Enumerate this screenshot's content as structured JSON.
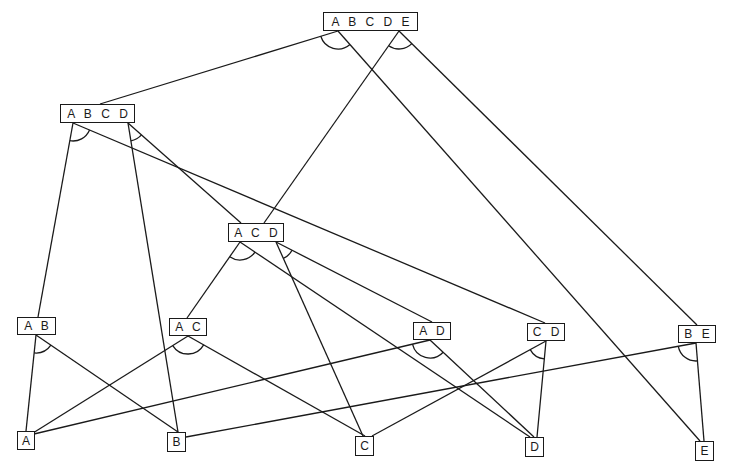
{
  "colors": {
    "stroke": "#1a1a1a",
    "background": "#ffffff"
  },
  "nodes": {
    "ABCDE": {
      "label": "A B C D E",
      "x": 323,
      "y": 12,
      "w": 95,
      "h": 19
    },
    "ABCD": {
      "label": "A B C D",
      "x": 60,
      "y": 104,
      "w": 75,
      "h": 19
    },
    "ACD": {
      "label": "A C D",
      "x": 228,
      "y": 223,
      "w": 56,
      "h": 19
    },
    "AB": {
      "label": "A B",
      "x": 17,
      "y": 317,
      "w": 39,
      "h": 18
    },
    "AC": {
      "label": "A C",
      "x": 169,
      "y": 318,
      "w": 38,
      "h": 18
    },
    "AD": {
      "label": "A D",
      "x": 413,
      "y": 322,
      "w": 38,
      "h": 18
    },
    "CD": {
      "label": "C D",
      "x": 527,
      "y": 323,
      "w": 38,
      "h": 18
    },
    "BE": {
      "label": "B E",
      "x": 678,
      "y": 325,
      "w": 38,
      "h": 18
    },
    "A": {
      "label": "A",
      "x": 17,
      "y": 431,
      "w": 18,
      "h": 19
    },
    "B": {
      "label": "B",
      "x": 167,
      "y": 432,
      "w": 19,
      "h": 20
    },
    "C": {
      "label": "C",
      "x": 355,
      "y": 436,
      "w": 19,
      "h": 20
    },
    "D": {
      "label": "D",
      "x": 525,
      "y": 437,
      "w": 19,
      "h": 20
    },
    "E": {
      "label": "E",
      "x": 695,
      "y": 441,
      "w": 19,
      "h": 20
    }
  },
  "hyperedges": [
    {
      "from": "ABCDE",
      "origin": [
        338,
        31
      ],
      "to": [
        {
          "node": "ABCD",
          "pt": [
            100,
            104
          ]
        },
        {
          "node": "E",
          "pt": [
            700,
            441
          ]
        }
      ]
    },
    {
      "from": "ABCDE",
      "origin": [
        399,
        31
      ],
      "to": [
        {
          "node": "ACD",
          "pt": [
            264,
            223
          ]
        },
        {
          "node": "BE",
          "pt": [
            697,
            325
          ]
        }
      ]
    },
    {
      "from": "ABCD",
      "origin": [
        73,
        123
      ],
      "to": [
        {
          "node": "AB",
          "pt": [
            38,
            317
          ]
        },
        {
          "node": "CD",
          "pt": [
            545,
            323
          ]
        }
      ]
    },
    {
      "from": "ABCD",
      "origin": [
        128,
        123
      ],
      "to": [
        {
          "node": "B",
          "pt": [
            178,
            432
          ]
        },
        {
          "node": "ACD",
          "pt": [
            241,
            223
          ]
        }
      ]
    },
    {
      "from": "ACD",
      "origin": [
        240,
        242
      ],
      "to": [
        {
          "node": "AC",
          "pt": [
            187,
            318
          ]
        },
        {
          "node": "D",
          "pt": [
            530,
            437
          ]
        }
      ]
    },
    {
      "from": "ACD",
      "origin": [
        276,
        242
      ],
      "to": [
        {
          "node": "C",
          "pt": [
            363,
            436
          ]
        },
        {
          "node": "AD",
          "pt": [
            432,
            322
          ]
        }
      ]
    },
    {
      "from": "AB",
      "origin": [
        36,
        335
      ],
      "to": [
        {
          "node": "A",
          "pt": [
            26,
            431
          ]
        },
        {
          "node": "B",
          "pt": [
            178,
            432
          ]
        }
      ]
    },
    {
      "from": "AC",
      "origin": [
        188,
        336
      ],
      "to": [
        {
          "node": "A",
          "pt": [
            33,
            433
          ]
        },
        {
          "node": "C",
          "pt": [
            365,
            436
          ]
        }
      ]
    },
    {
      "from": "AD",
      "origin": [
        430,
        340
      ],
      "to": [
        {
          "node": "A",
          "pt": [
            34,
            434
          ]
        },
        {
          "node": "D",
          "pt": [
            534,
            437
          ]
        }
      ]
    },
    {
      "from": "CD",
      "origin": [
        546,
        341
      ],
      "to": [
        {
          "node": "C",
          "pt": [
            372,
            436
          ]
        },
        {
          "node": "D",
          "pt": [
            537,
            437
          ]
        }
      ]
    },
    {
      "from": "BE",
      "origin": [
        696,
        343
      ],
      "to": [
        {
          "node": "B",
          "pt": [
            186,
            437
          ]
        },
        {
          "node": "E",
          "pt": [
            704,
            441
          ]
        }
      ]
    }
  ]
}
